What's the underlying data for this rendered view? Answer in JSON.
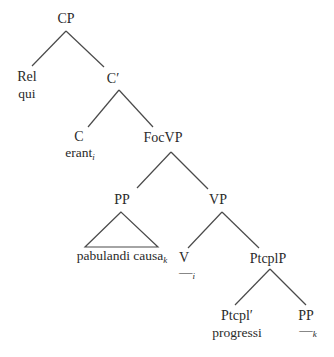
{
  "tree": {
    "nodes": {
      "cp": "CP",
      "rel": "Rel",
      "qui": "qui",
      "cbar": "C′",
      "c": "C",
      "erant": "erant",
      "erant_index": "i",
      "focvp": "FocVP",
      "pp1": "PP",
      "pabulandi": "pabulandi causa",
      "pabulandi_index": "k",
      "vp": "VP",
      "v": "V",
      "v_trace": "—",
      "v_trace_index": "i",
      "ptcplp": "PtcplP",
      "ptcplbar": "Ptcpl′",
      "progressi": "progressi",
      "pp2": "PP",
      "pp2_trace": "—",
      "pp2_trace_index": "k"
    },
    "line_color": "#4a4a4a"
  }
}
